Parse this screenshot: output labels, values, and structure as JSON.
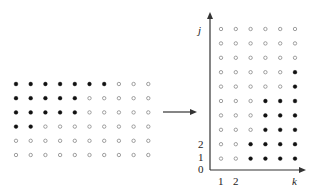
{
  "left_grid": {
    "rows": 6,
    "cols": 10,
    "filled_per_row": [
      7,
      5,
      5,
      2,
      0,
      0
    ],
    "origin": {
      "x": 16,
      "y": 84
    },
    "spacing": {
      "x": 14.7,
      "y": 14.2
    }
  },
  "arrow": {
    "x1": 163,
    "y1": 112,
    "x2": 197,
    "y2": 112
  },
  "right_grid": {
    "rows": 10,
    "cols": 6,
    "filled_per_row_top_to_bottom": [
      0,
      0,
      0,
      1,
      1,
      3,
      3,
      3,
      4,
      4
    ],
    "origin": {
      "x": 221,
      "y": 29
    },
    "spacing": {
      "x": 14.8,
      "y": 14.4
    }
  },
  "axes": {
    "origin": {
      "x": 210,
      "y": 170
    },
    "y_axis_top": 12,
    "x_axis_right": 306,
    "y_label": "j",
    "x_label": "k",
    "y_ticks": [
      "0",
      "1",
      "2"
    ],
    "x_ticks": [
      "1",
      "2"
    ]
  },
  "colors": {
    "filled": "#111111",
    "hollow_stroke": "#888888",
    "axis": "#333333"
  }
}
